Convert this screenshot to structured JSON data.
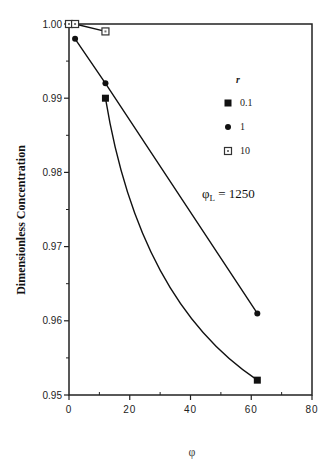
{
  "chart_data": {
    "type": "line",
    "title": "",
    "xlabel": "φ",
    "ylabel": "Dimensionless  Concentration",
    "xlim": [
      0,
      80
    ],
    "ylim": [
      0.95,
      1.0
    ],
    "x_ticks": [
      "0",
      "20",
      "40",
      "60",
      "80"
    ],
    "y_ticks": [
      "0.95",
      "0.96",
      "0.97",
      "0.98",
      "0.99",
      "1.00"
    ],
    "grid": false,
    "legend": {
      "title": "r",
      "position": "upper right inside",
      "entries": [
        {
          "label": "0.1",
          "marker": "filled-square"
        },
        {
          "label": "1",
          "marker": "filled-circle"
        },
        {
          "label": "10",
          "marker": "open-square"
        }
      ]
    },
    "annotation": {
      "text_main": "φ",
      "text_sub": "L",
      "text_rest": " = 1250"
    },
    "series": [
      {
        "name": "0.1",
        "marker": "filled-square",
        "x": [
          12,
          62
        ],
        "y": [
          0.99,
          0.952
        ],
        "curve": "smooth-convex"
      },
      {
        "name": "1",
        "marker": "filled-circle",
        "x": [
          2,
          12,
          62
        ],
        "y": [
          0.998,
          0.992,
          0.961
        ],
        "curve": "straight"
      },
      {
        "name": "10",
        "marker": "open-square",
        "x": [
          0,
          2,
          12
        ],
        "y": [
          1.0,
          1.0,
          0.999
        ],
        "curve": "straight"
      }
    ]
  }
}
